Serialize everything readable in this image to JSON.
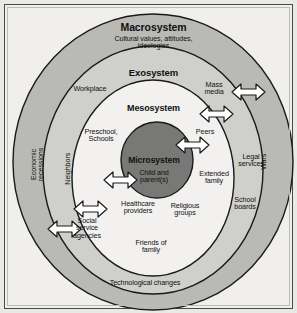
{
  "figure": {
    "colors": {
      "page_background": "#f0efed",
      "macrosystem_fill": "#b9b9b5",
      "exosystem_fill": "#cfcfcb",
      "mesosystem_fill": "#f2f1ef",
      "microsystem_fill": "#787876",
      "outline": "#1a1a1a",
      "arrow_fill": "#ffffff",
      "text": "#111111"
    }
  },
  "systems": [
    {
      "name": "macrosystem",
      "label": "Macrosystem",
      "sublabel": "Cultural values, attitudes,\nideologies"
    },
    {
      "name": "exosystem",
      "label": "Exosystem",
      "sublabel": ""
    },
    {
      "name": "mesosystem",
      "label": "Mesosystem",
      "sublabel": ""
    },
    {
      "name": "microsystem",
      "label": "Microsystem",
      "sublabel": "Child and\nparent(s)"
    }
  ],
  "labels": {
    "workplace": "Workplace",
    "mass_media": "Mass\nmedia",
    "preschool_schools": "Preschool,\nSchools",
    "peers": "Peers",
    "extended_family": "Extended\nfamily",
    "legal_services": "Legal\nservices",
    "religious_groups": "Religious\ngroups",
    "school_boards": "School\nboards",
    "healthcare_providers": "Healthcare\nproviders",
    "social_service_agencies": "Social\nservice\nagencies",
    "friends_of_family": "Friends of\nfamily",
    "technological_changes": "Technological changes",
    "economic_recessions": "Economic\nrecessions",
    "neighbors": "Neighbors",
    "wars": "Wars"
  },
  "arrows": [
    {
      "name": "arrow-mass-media",
      "direction": "bidirectional"
    },
    {
      "name": "arrow-peers-outer",
      "direction": "bidirectional"
    },
    {
      "name": "arrow-microsystem-right",
      "direction": "bidirectional"
    },
    {
      "name": "arrow-microsystem-left",
      "direction": "bidirectional"
    },
    {
      "name": "arrow-healthcare",
      "direction": "bidirectional"
    },
    {
      "name": "arrow-social-service",
      "direction": "bidirectional"
    }
  ]
}
